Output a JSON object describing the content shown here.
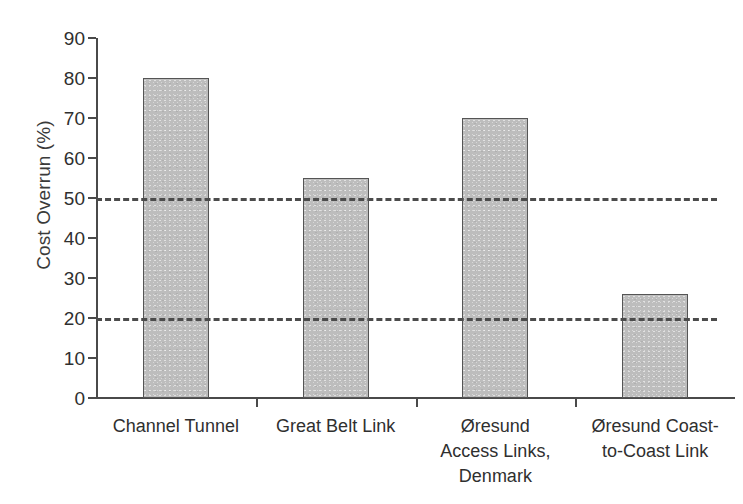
{
  "chart_data": {
    "type": "bar",
    "title": "",
    "xlabel": "",
    "ylabel": "Cost Overrun (%)",
    "categories": [
      "Channel Tunnel",
      "Great Belt Link",
      "Øresund Access Links, Denmark",
      "Øresund Coast-to-Coast Link"
    ],
    "category_lines": [
      [
        "Channel Tunnel"
      ],
      [
        "Great Belt Link"
      ],
      [
        "Øresund",
        "Access Links,",
        "Denmark"
      ],
      [
        "Øresund Coast-",
        "to-Coast Link"
      ]
    ],
    "values": [
      80,
      55,
      70,
      26
    ],
    "ylim": [
      0,
      90
    ],
    "ytick_values": [
      0,
      10,
      20,
      30,
      40,
      50,
      60,
      70,
      80,
      90
    ],
    "ytick_labels": [
      "0",
      "10",
      "20",
      "30",
      "40",
      "50",
      "60",
      "70",
      "80",
      "90"
    ],
    "reference_lines": [
      {
        "value": 50,
        "style": "dashed"
      },
      {
        "value": 20,
        "style": "dashed"
      }
    ],
    "grid": false,
    "legend": "none",
    "bar_fill_color": "#bdbdbd",
    "bar_edge_color": "#555555",
    "axis_color": "#4a4a4a",
    "reference_line_color": "#4c4c4c",
    "background_color": "#ffffff"
  }
}
